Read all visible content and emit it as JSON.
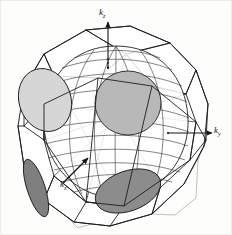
{
  "figure": {
    "kind": "fermi-surface-brillouin-zone-diagram",
    "caption_text": "",
    "background_color": "#fdfdfc",
    "line_color": "#1a1a1a"
  },
  "axes": {
    "kz": {
      "symbol": "k",
      "subscript": "z",
      "arrow": "up",
      "arrow_length_px": 52
    },
    "ky": {
      "symbol": "k",
      "subscript": "y",
      "arrow": "right",
      "arrow_length_px": 48
    },
    "kx": {
      "symbol": "k",
      "subscript": "x",
      "arrow": "up-right",
      "arrow_length_px": 34
    }
  },
  "zone": {
    "name": "truncated-octahedron-brillouin-zone",
    "edge_color": "#1d1d1d",
    "hidden_edge_color": "#9a9a9a",
    "face_fill": "#ffffff"
  },
  "fermi_surface": {
    "name": "fermi-surface-body",
    "fill": "#ffffff",
    "contour_color": "#2a2a2a",
    "contour_count": 12
  },
  "necks": [
    {
      "name": "neck-upper-left",
      "fill": "#d6d6d6",
      "stroke": "#1f1f1f",
      "cx": 45,
      "cy": 100,
      "rx": 26,
      "ry": 32,
      "rotation": -18
    },
    {
      "name": "neck-upper-right",
      "fill": "#b8b8b8",
      "stroke": "#1f1f1f",
      "cx": 128,
      "cy": 103,
      "rx": 33,
      "ry": 32,
      "rotation": 0
    },
    {
      "name": "neck-lower-left",
      "fill": "#7f7f7f",
      "stroke": "#1f1f1f",
      "cx": 36,
      "cy": 188,
      "rx": 9,
      "ry": 30,
      "rotation": -18
    },
    {
      "name": "neck-lower-right",
      "fill": "#8c8c8c",
      "stroke": "#1f1f1f",
      "cx": 128,
      "cy": 191,
      "rx": 34,
      "ry": 20,
      "rotation": -20
    }
  ],
  "colors": {
    "ink": "#1a1a1a",
    "light_gray": "#d6d6d6",
    "mid_gray": "#b8b8b8",
    "dark_gray": "#8c8c8c",
    "darkest_gray": "#7f7f7f",
    "hidden_line": "#9a9a9a"
  }
}
